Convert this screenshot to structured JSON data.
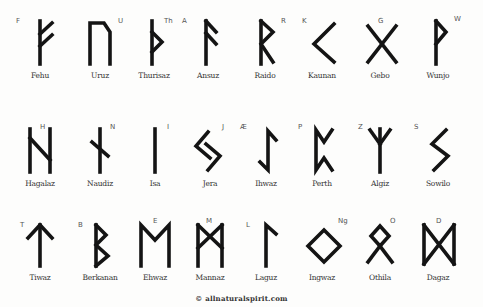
{
  "rows": [
    [
      {
        "name": "Fehu",
        "letter": "F",
        "icon": "fehu-rune-icon"
      },
      {
        "name": "Uruz",
        "letter": "U",
        "icon": "uruz-rune-icon"
      },
      {
        "name": "Thurisaz",
        "letter": "Th",
        "icon": "thurisaz-rune-icon"
      },
      {
        "name": "Ansuz",
        "letter": "A",
        "icon": "ansuz-rune-icon"
      },
      {
        "name": "Raido",
        "letter": "R",
        "icon": "raido-rune-icon"
      },
      {
        "name": "Kaunan",
        "letter": "K",
        "icon": "kaunan-rune-icon"
      },
      {
        "name": "Gebo",
        "letter": "G",
        "icon": "gebo-rune-icon"
      },
      {
        "name": "Wunjo",
        "letter": "W",
        "icon": "wunjo-rune-icon"
      }
    ],
    [
      {
        "name": "Hagalaz",
        "letter": "H",
        "icon": "hagalaz-rune-icon"
      },
      {
        "name": "Naudiz",
        "letter": "N",
        "icon": "naudiz-rune-icon"
      },
      {
        "name": "Isa",
        "letter": "I",
        "icon": "isa-rune-icon"
      },
      {
        "name": "Jera",
        "letter": "J",
        "icon": "jera-rune-icon"
      },
      {
        "name": "Ihwaz",
        "letter": "Æ",
        "icon": "ihwaz-rune-icon"
      },
      {
        "name": "Perth",
        "letter": "P",
        "icon": "perth-rune-icon"
      },
      {
        "name": "Algiz",
        "letter": "Z",
        "icon": "algiz-rune-icon"
      },
      {
        "name": "Sowilo",
        "letter": "S",
        "icon": "sowilo-rune-icon"
      }
    ],
    [
      {
        "name": "Tiwaz",
        "letter": "T",
        "icon": "tiwaz-rune-icon"
      },
      {
        "name": "Berkanan",
        "letter": "B",
        "icon": "berkanan-rune-icon"
      },
      {
        "name": "Ehwaz",
        "letter": "E",
        "icon": "ehwaz-rune-icon"
      },
      {
        "name": "Mannaz",
        "letter": "M",
        "icon": "mannaz-rune-icon"
      },
      {
        "name": "Laguz",
        "letter": "L",
        "icon": "laguz-rune-icon"
      },
      {
        "name": "Ingwaz",
        "letter": "Ng",
        "icon": "ingwaz-rune-icon"
      },
      {
        "name": "Othila",
        "letter": "O",
        "icon": "othila-rune-icon"
      },
      {
        "name": "Dagaz",
        "letter": "D",
        "icon": "dagaz-rune-icon"
      }
    ]
  ],
  "footer": "© allnaturalspirit.com",
  "colors": {
    "ink": "#141414",
    "background": "#fdfdfc",
    "label": "#333333"
  }
}
